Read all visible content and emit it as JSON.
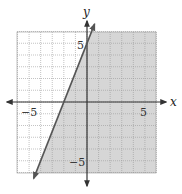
{
  "chart_data": {
    "type": "line",
    "title": "",
    "xlabel": "x",
    "ylabel": "y",
    "xlim": [
      -6,
      6
    ],
    "ylim": [
      -6,
      6
    ],
    "grid": true,
    "tick_labels": {
      "x": [
        {
          "value": -5,
          "label": "−5"
        },
        {
          "value": 5,
          "label": "5"
        }
      ],
      "y": [
        {
          "value": 5,
          "label": "5"
        },
        {
          "value": -5,
          "label": "−5"
        }
      ]
    },
    "series": [
      {
        "name": "boundary line",
        "equation": "y = 2.5x + 5",
        "style": "solid",
        "x": [
          -4.4,
          0.5
        ],
        "y": [
          -6,
          6.25
        ]
      }
    ],
    "shaded_region": {
      "description": "region to the right of/below the line",
      "inequality": "y < 2.5x + 5",
      "color": "#d9d9d9"
    }
  },
  "colors": {
    "shade": "#d6d6d6",
    "grid": "#9a9a9a",
    "axis": "#333333",
    "line": "#555555"
  },
  "labels": {
    "x_axis": "x",
    "y_axis": "y",
    "x_neg5": "−5",
    "x_pos5": "5",
    "y_pos5": "5",
    "y_neg5": "−5"
  }
}
